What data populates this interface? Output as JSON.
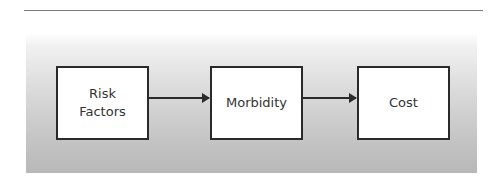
{
  "diagram": {
    "type": "flowchart",
    "nodes": [
      {
        "id": "risk-factors",
        "label": "Risk\nFactors"
      },
      {
        "id": "morbidity",
        "label": "Morbidity"
      },
      {
        "id": "cost",
        "label": "Cost"
      }
    ],
    "edges": [
      {
        "from": "risk-factors",
        "to": "morbidity"
      },
      {
        "from": "morbidity",
        "to": "cost"
      }
    ],
    "colors": {
      "box_border": "#2a2a2a",
      "box_fill": "#ffffff",
      "panel_gradient_top": "#ffffff",
      "panel_gradient_bottom": "#b8b8b8",
      "text": "#333333"
    }
  }
}
